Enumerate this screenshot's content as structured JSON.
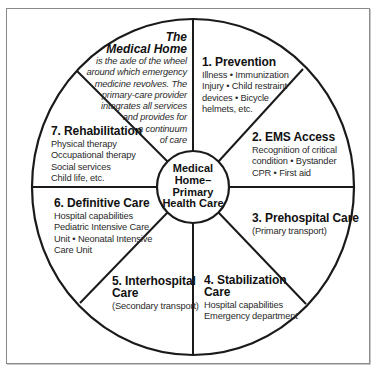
{
  "diagram": {
    "type": "wheel",
    "hub": {
      "lines": [
        "Medical",
        "Home–",
        "Primary",
        "Health Care"
      ]
    },
    "medical_home_note": {
      "title_lines": [
        "The",
        "Medical Home"
      ],
      "body_lines": [
        "is the axle of the wheel",
        "around which emergency",
        "medicine revolves. The",
        "primary-care provider",
        "integrates all services",
        "and provides for",
        "a continuum",
        "of care"
      ]
    },
    "segments": [
      {
        "title_lines": [
          "1. Prevention"
        ],
        "body_lines": [
          "Illness • Immunization",
          "Injury • Child restraint",
          "devices • Bicycle",
          "helmets, etc."
        ]
      },
      {
        "title_lines": [
          "2. EMS Access"
        ],
        "body_lines": [
          "Recognition of critical",
          "condition • Bystander",
          "CPR • First aid"
        ]
      },
      {
        "title_lines": [
          "3. Prehospital Care"
        ],
        "body_lines": [
          "(Primary transport)"
        ]
      },
      {
        "title_lines": [
          "4. Stabilization",
          "Care"
        ],
        "body_lines": [
          "Hospital capabilities",
          "Emergency department"
        ]
      },
      {
        "title_lines": [
          "5. Interhospital",
          "Care"
        ],
        "body_lines": [
          "(Secondary transport)"
        ]
      },
      {
        "title_lines": [
          "6. Definitive Care"
        ],
        "body_lines": [
          "Hospital capabilities",
          "Pediatric Intensive Care",
          "Unit • Neonatal Intensive",
          "Care Unit"
        ]
      },
      {
        "title_lines": [
          "7. Rehabilitation"
        ],
        "body_lines": [
          "Physical therapy",
          "Occupational therapy",
          "Social services",
          "Child life, etc."
        ]
      }
    ],
    "colors": {
      "stroke": "#1a1a1a",
      "frame": "#8a8a8a",
      "background": "#ffffff"
    }
  }
}
